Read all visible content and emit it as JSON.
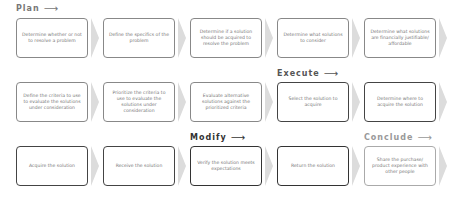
{
  "phases": {
    "plan": {
      "label": "Plan",
      "arrow": "⟶",
      "color": "#777777"
    },
    "execute": {
      "label": "Execute",
      "arrow": "⟶",
      "color": "#555555"
    },
    "modify": {
      "label": "Modify",
      "arrow": "⟶",
      "color": "#333333"
    },
    "conclude": {
      "label": "Conclude",
      "arrow": "⟶",
      "color": "#999999"
    }
  },
  "rows": [
    {
      "steps": [
        {
          "text": "Determine whether or not to resolve a problem"
        },
        {
          "text": "Define the specifics of the problem"
        },
        {
          "text": "Determine if a solution should be acquired to resolve the problem"
        },
        {
          "text": "Determine what solutions to consider"
        },
        {
          "text": "Determine what solutions are financially justifiable/ affordable"
        }
      ]
    },
    {
      "steps": [
        {
          "text": "Define the criteria to use to evaluate the solutions under consideration"
        },
        {
          "text": "Prioritize the criteria to use to evaluate the solutions under consideration"
        },
        {
          "text": "Evaluate alternative solutions against the prioritized criteria"
        },
        {
          "text": "Select the solution to acquire"
        },
        {
          "text": "Determine where to acquire the solution"
        }
      ]
    },
    {
      "steps": [
        {
          "text": "Acquire the solution"
        },
        {
          "text": "Receive the solution"
        },
        {
          "text": "Verify the solution meets expectations"
        },
        {
          "text": "Return the solution"
        },
        {
          "text": "Share the purchase/ product experience with other people"
        }
      ]
    }
  ]
}
